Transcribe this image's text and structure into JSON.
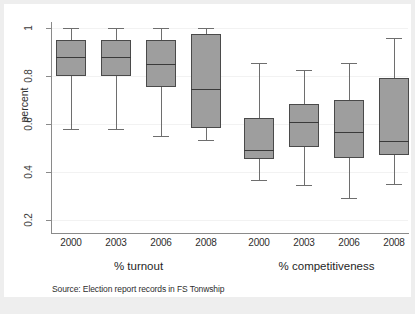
{
  "chart_data": {
    "type": "box",
    "title": "",
    "xlabel": "",
    "ylabel": "percent",
    "ylim": [
      0.2,
      1.0
    ],
    "yticks": [
      0.2,
      0.4,
      0.6,
      0.8,
      1.0
    ],
    "ytick_labels": [
      "0.2",
      "0.4",
      "0.6",
      "0.8",
      "1"
    ],
    "grid": true,
    "legend": "none",
    "source_note": "Source: Election report records in FS Tonwship",
    "groups": [
      {
        "name": "% turnout",
        "categories": [
          "2000",
          "2003",
          "2006",
          "2008"
        ],
        "boxes": [
          {
            "label": "2000",
            "whisker_low": 0.58,
            "q1": 0.8,
            "median": 0.88,
            "q3": 0.95,
            "whisker_high": 1.0
          },
          {
            "label": "2003",
            "whisker_low": 0.58,
            "q1": 0.8,
            "median": 0.88,
            "q3": 0.95,
            "whisker_high": 1.0
          },
          {
            "label": "2006",
            "whisker_low": 0.55,
            "q1": 0.755,
            "median": 0.85,
            "q3": 0.95,
            "whisker_high": 1.0
          },
          {
            "label": "2008",
            "whisker_low": 0.535,
            "q1": 0.585,
            "median": 0.745,
            "q3": 0.975,
            "whisker_high": 1.0
          }
        ]
      },
      {
        "name": "% competitiveness",
        "categories": [
          "2000",
          "2003",
          "2006",
          "2008"
        ],
        "boxes": [
          {
            "label": "2000",
            "whisker_low": 0.365,
            "q1": 0.455,
            "median": 0.49,
            "q3": 0.625,
            "whisker_high": 0.855
          },
          {
            "label": "2003",
            "whisker_low": 0.345,
            "q1": 0.505,
            "median": 0.61,
            "q3": 0.685,
            "whisker_high": 0.825
          },
          {
            "label": "2006",
            "whisker_low": 0.29,
            "q1": 0.46,
            "median": 0.565,
            "q3": 0.7,
            "whisker_high": 0.855
          },
          {
            "label": "2008",
            "whisker_low": 0.35,
            "q1": 0.47,
            "median": 0.53,
            "q3": 0.79,
            "whisker_high": 0.96
          }
        ]
      }
    ],
    "colors": {
      "box_fill": "#9e9e9e",
      "box_edge": "#4a4a4a",
      "median": "#3a3a3a",
      "whisker": "#6e6e6e",
      "gridline": "#f2f2f2",
      "axis": "#8a8a8a",
      "canvas": "#ffffff",
      "figure_background": "#eeeeee"
    }
  }
}
